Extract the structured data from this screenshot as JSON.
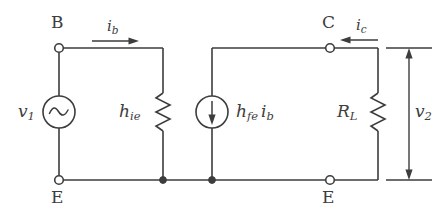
{
  "figure": {
    "line_color": "#3d3d3d",
    "background_color": "#ffffff",
    "text_color": "#3d3d3d"
  },
  "terminals": {
    "base": "B",
    "collector": "C",
    "emitter_left": "E",
    "emitter_right": "E"
  },
  "sources": {
    "input_voltage": {
      "symbol": "v",
      "subscript": "1",
      "type": "ac-voltage-source"
    },
    "dependent_current": {
      "symbol_h": "h",
      "subscript_h": "fe",
      "symbol_i": "i",
      "subscript_i": "b",
      "type": "dependent-current-source"
    }
  },
  "components": {
    "input_resistance": {
      "symbol": "h",
      "subscript": "ie",
      "type": "resistor"
    },
    "load_resistance": {
      "symbol": "R",
      "subscript": "L",
      "type": "resistor"
    }
  },
  "currents": {
    "base_current": {
      "symbol": "i",
      "subscript": "b",
      "direction": "right"
    },
    "collector_current": {
      "symbol": "i",
      "subscript": "c",
      "direction": "left"
    }
  },
  "measurements": {
    "output_voltage": {
      "symbol": "v",
      "subscript": "2",
      "type": "dimension-arrow",
      "direction": "both"
    }
  }
}
